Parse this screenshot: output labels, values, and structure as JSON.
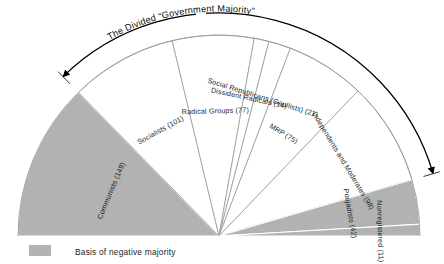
{
  "figure": {
    "title": "The Divided “Government Majority”",
    "background_color": "#ffffff",
    "highlight_color": "#b2b2b2",
    "plain_color": "#ffffff",
    "outline_color": "#9a9a9a",
    "text_color": "#1c1c1c",
    "annotation_color": "#000000"
  },
  "legend": {
    "swatch_color": "#b2b2b2",
    "label": "Basis of negative majority"
  },
  "annotation": {
    "label": "The Divided “Government Majority”",
    "type": "double-headed-arc-arrow",
    "spans_from": "Socialists (101)",
    "spans_to": "Independents and Moderates (98)"
  },
  "chart_data": {
    "type": "pie",
    "variant": "semicircle",
    "title": "The Divided “Government Majority”",
    "xlabel": "",
    "ylabel": "",
    "units": "seats",
    "total": 587,
    "start_angle_deg": 180,
    "end_angle_deg": 360,
    "legend_position": "bottom-left",
    "grid": false,
    "categories": [
      "Communists (149)",
      "Socialists (101)",
      "Radical Groups (77)",
      "Dissident Radicals (14)",
      "Social Republicans (Gaullists) (21)",
      "MRP (75)",
      "Independents and Moderates (98)",
      "Poujadists (42)",
      "Nonregistered (11)"
    ],
    "values": [
      149,
      101,
      77,
      14,
      21,
      75,
      98,
      42,
      11
    ],
    "slices": [
      {
        "name": "Communists",
        "seats": 149,
        "label": "Communists (149)",
        "shaded": true
      },
      {
        "name": "Socialists",
        "seats": 101,
        "label": "Socialists (101)",
        "shaded": false
      },
      {
        "name": "Radical Groups",
        "seats": 77,
        "label": "Radical Groups (77)",
        "shaded": false
      },
      {
        "name": "Dissident Radicals",
        "seats": 14,
        "label": "Dissident Radicals (14)",
        "shaded": false
      },
      {
        "name": "Social Republicans (Gaullists)",
        "seats": 21,
        "label": "Social Republicans (Gaullists) (21)",
        "shaded": false
      },
      {
        "name": "MRP",
        "seats": 75,
        "label": "MRP (75)",
        "shaded": false
      },
      {
        "name": "Independents and Moderates",
        "seats": 98,
        "label": "Independents and Moderates (98)",
        "shaded": false
      },
      {
        "name": "Poujadists",
        "seats": 42,
        "label": "Poujadists (42)",
        "shaded": true
      },
      {
        "name": "Nonregistered",
        "seats": 11,
        "label": "Nonregistered (11)",
        "shaded": true
      }
    ]
  }
}
